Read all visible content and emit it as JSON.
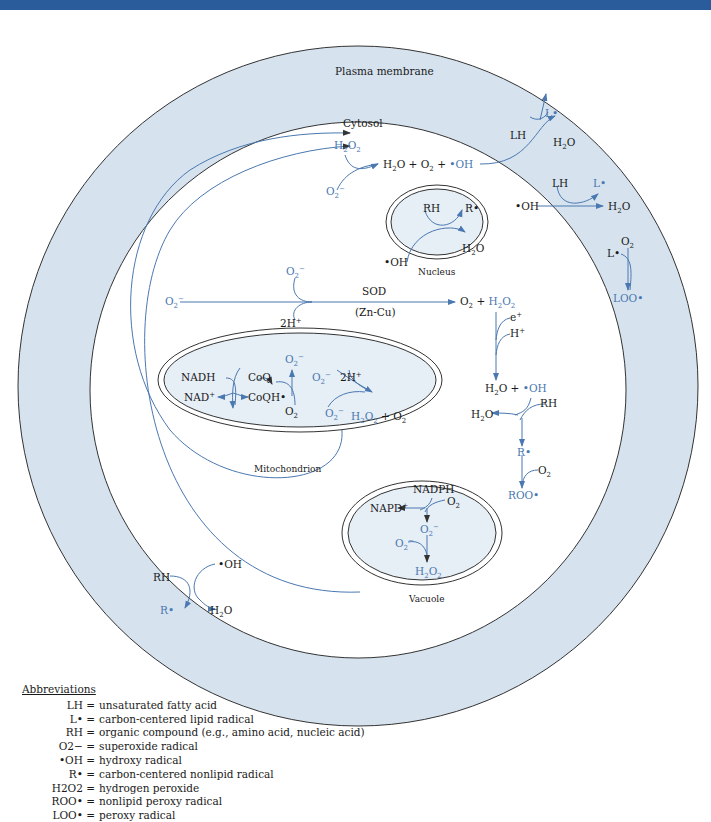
{
  "header_bar": {
    "color": "#2a5b9a"
  },
  "colors": {
    "membrane_fill": "#d6e3ef",
    "organelle_fill": "#e6eef6",
    "accent_blue": "#4a78b0",
    "outline": "#333333"
  },
  "compartments": {
    "plasma_membrane": "Plasma membrane",
    "cytosol": "Cytosol",
    "nucleus": "Nucleus",
    "mitochondrion": "Mitochondrion",
    "vacuole": "Vacuole"
  },
  "cytosol_reaction": {
    "h2o2": "H2O2",
    "o2minus": "O2−",
    "products": "H2O + O2 + ",
    "oh": "•OH"
  },
  "membrane_top": {
    "lh": "LH",
    "l_rad": "L•",
    "h2o": "H2O"
  },
  "membrane_right": {
    "oh": "•OH",
    "lh": "LH",
    "l_rad": "L•",
    "h2o": "H2O"
  },
  "membrane_loo": {
    "l_rad": "L•",
    "o2": "O2",
    "loo": "LOO•"
  },
  "nucleus_rxn": {
    "rh": "RH",
    "r_rad": "R•",
    "h2o": "H2O",
    "oh": "•OH"
  },
  "sod_rxn": {
    "o2minus_left": "O2−",
    "o2minus_top": "O2−",
    "h": "2H+",
    "enzyme": "SOD",
    "cofactor": "(Zn-Cu)",
    "product_o2": "O2 + ",
    "product_h2o2": "H2O2"
  },
  "fenton": {
    "e": "e+",
    "h": "H+",
    "h2o": "H2O + ",
    "oh": "•OH",
    "rh": "RH",
    "h2o_out": "H2O",
    "r_rad": "R•",
    "o2": "O2",
    "roo": "ROO•"
  },
  "mito_rxn": {
    "nadh": "NADH",
    "nad": "NAD+",
    "coq": "CoQ",
    "coqh": "CoQH•",
    "o2": "O2",
    "o2minus_top": "O2−",
    "o2minus_a": "O2−",
    "o2minus_b": "O2−",
    "h": "2H+",
    "h2o2": "H2O2",
    "o2_prod": " + O2"
  },
  "vacuole_rxn": {
    "nadph": "NADPH",
    "napd": "NAPD+",
    "o2": "O2",
    "o2minus_mid": "O2−",
    "o2minus_left": "O2−",
    "h2o2": "H2O2"
  },
  "membrane_bottom": {
    "oh": "•OH",
    "rh": "RH",
    "r_rad": "R•",
    "h2o": "H2O"
  },
  "abbreviations": {
    "title": "Abbreviations",
    "items": [
      {
        "key": "LH =",
        "value": "unsaturated fatty acid"
      },
      {
        "key": "L• =",
        "value": "carbon-centered lipid radical"
      },
      {
        "key": "RH =",
        "value": "organic compound (e.g., amino acid, nucleic acid)"
      },
      {
        "key": "O2− =",
        "value": "superoxide radical"
      },
      {
        "key": "•OH =",
        "value": "hydroxy radical"
      },
      {
        "key": "R• =",
        "value": "carbon-centered nonlipid radical"
      },
      {
        "key": "H2O2 =",
        "value": "hydrogen peroxide"
      },
      {
        "key": "ROO• =",
        "value": "nonlipid peroxy radical"
      },
      {
        "key": "LOO• =",
        "value": "peroxy radical"
      }
    ]
  }
}
